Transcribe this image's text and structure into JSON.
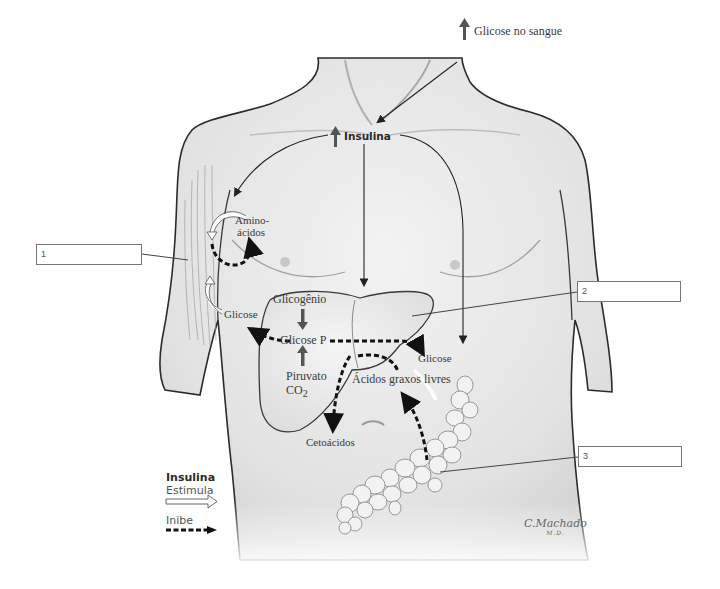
{
  "diagram": {
    "type": "anatomical-illustration",
    "labels": {
      "blood_glucose": "Glicose no sangue",
      "insulin": "Insulina",
      "amino_acids_line1": "Amino-",
      "amino_acids_line2": "ácidos",
      "glucose_muscle": "Glicose",
      "glycogen": "Glicogênio",
      "glucose_p": "Glicose P",
      "pyruvate": "Piruvato",
      "co2": "CO",
      "co2_sub": "2",
      "glucose_adipose": "Glicose",
      "free_fatty_acids": "Ácidos graxos livres",
      "ketoacids": "Cetoácidos"
    },
    "answer_boxes": [
      {
        "number": "1",
        "points_to": "arm muscle"
      },
      {
        "number": "2",
        "points_to": "liver"
      },
      {
        "number": "3",
        "points_to": "adipose tissue"
      }
    ],
    "legend": {
      "title": "Insulina",
      "stimulates": "Estimula",
      "inhibits": "Inibe"
    },
    "signature": {
      "name": "C.Machado",
      "suffix": "M.D."
    },
    "colors": {
      "skin_shade": "#e6e6e6",
      "outline": "#2b2b2b",
      "arrow": "#222222",
      "up_arrow": "#555555",
      "box_border": "#777777"
    }
  }
}
